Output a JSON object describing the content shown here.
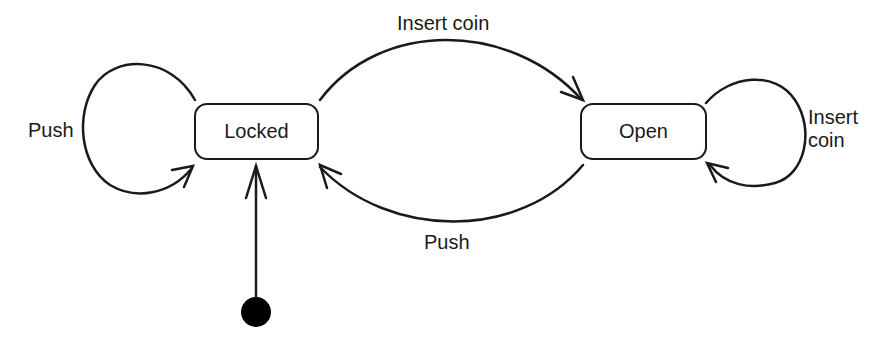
{
  "diagram": {
    "type": "state-machine",
    "colors": {
      "stroke": "#1a1a1a",
      "background": "#ffffff"
    },
    "states": [
      {
        "id": "locked",
        "label": "Locked",
        "initial": true
      },
      {
        "id": "open",
        "label": "Open",
        "initial": false
      }
    ],
    "transitions": [
      {
        "from": "locked",
        "to": "locked",
        "label": "Push"
      },
      {
        "from": "locked",
        "to": "open",
        "label": "Insert coin"
      },
      {
        "from": "open",
        "to": "locked",
        "label": "Push"
      },
      {
        "from": "open",
        "to": "open",
        "label": "Insert\ncoin",
        "label_line1": "Insert",
        "label_line2": "coin"
      }
    ],
    "initial_marker": {
      "to": "locked"
    }
  }
}
